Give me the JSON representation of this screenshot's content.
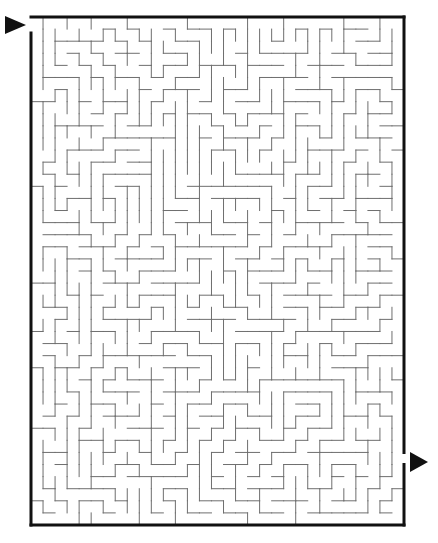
{
  "puzzle": {
    "type": "maze",
    "title": "Maze",
    "grid": {
      "cols": 31,
      "rows": 42,
      "cell_size": 12.05
    },
    "border": {
      "x1": 31,
      "y1": 17,
      "x2": 404,
      "y2": 525,
      "color": "#111111",
      "width": 3
    },
    "wall_color": "#6e6e6e",
    "start": {
      "side": "left",
      "row": 0,
      "arrow": {
        "x": 5,
        "y": 25
      }
    },
    "finish": {
      "side": "right",
      "row": 36,
      "arrow": {
        "x": 410,
        "y": 462
      }
    },
    "arrow_color": "#111111",
    "seed": 20240517
  }
}
